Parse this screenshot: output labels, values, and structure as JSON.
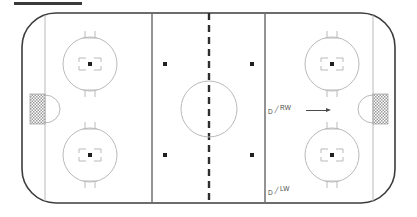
{
  "diagram": {
    "title_bar": "",
    "type": "ice-hockey-rink",
    "surface_label": "ice-surface"
  },
  "colors": {
    "board": "#3c3c3c",
    "ice": "#ffffff",
    "line_light": "#b9b9b9",
    "line_blue": "#6f6f6f",
    "center_line": "#2e2e2e",
    "dot": "#202020",
    "net_hatch": "#8f8f8f",
    "annotation": "#4a4a4a"
  },
  "annotations": [
    {
      "id": "rw",
      "position_left": "D",
      "separator": "/",
      "position_right": "RW",
      "arrow": "right-arrow",
      "x": 268,
      "y": 104
    },
    {
      "id": "lw",
      "position_left": "D",
      "separator": "/",
      "position_right": "LW",
      "arrow": "",
      "x": 268,
      "y": 185
    }
  ],
  "markings": {
    "goal_lines": [
      45,
      373
    ],
    "blue_lines": [
      152,
      265
    ],
    "center_line": 209,
    "center_line_style": "dashed",
    "faceoff_circles": [
      {
        "name": "left-top",
        "cx": 90,
        "cy": 64,
        "r": 27
      },
      {
        "name": "left-bottom",
        "cx": 90,
        "cy": 155,
        "r": 27
      },
      {
        "name": "right-top",
        "cx": 332,
        "cy": 64,
        "r": 27
      },
      {
        "name": "right-bottom",
        "cx": 332,
        "cy": 155,
        "r": 27
      },
      {
        "name": "center",
        "cx": 209,
        "cy": 109,
        "r": 28
      }
    ],
    "neutral_dots": [
      {
        "name": "neutral-top-left",
        "cx": 165,
        "cy": 64
      },
      {
        "name": "neutral-top-right",
        "cx": 252,
        "cy": 64
      },
      {
        "name": "neutral-bottom-left",
        "cx": 165,
        "cy": 155
      },
      {
        "name": "neutral-bottom-right",
        "cx": 252,
        "cy": 155
      }
    ],
    "goals": [
      {
        "name": "left-goal",
        "x": 45,
        "cy": 109
      },
      {
        "name": "right-goal",
        "x": 373,
        "cy": 109
      }
    ]
  }
}
